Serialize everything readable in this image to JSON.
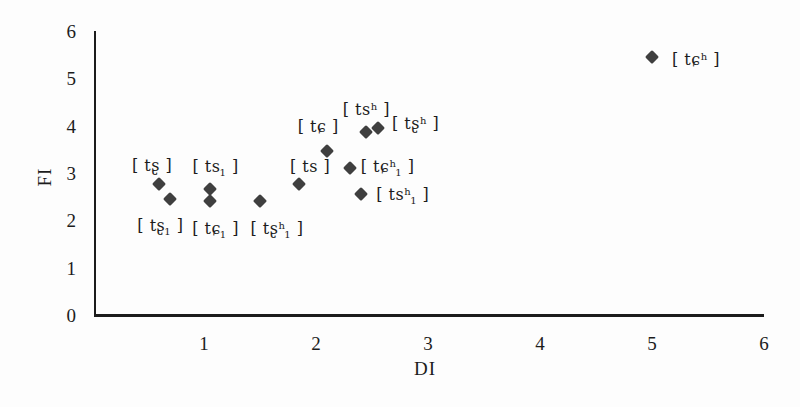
{
  "chart_data": {
    "type": "scatter",
    "title": "",
    "xlabel": "DI",
    "ylabel": "FI",
    "xlim": [
      0,
      6
    ],
    "ylim": [
      0,
      6
    ],
    "x_ticks": [
      "1",
      "2",
      "3",
      "4",
      "5",
      "6"
    ],
    "y_ticks": [
      "0",
      "1",
      "2",
      "3",
      "4",
      "5",
      "6"
    ],
    "grid": false,
    "legend": "none",
    "marker": {
      "shape": "diamond",
      "color": "#3f3f3f",
      "size_px": 10
    },
    "points": [
      {
        "id": "ts-retroflex",
        "label": "[tʂ]",
        "x": 0.6,
        "y": 2.8,
        "segments": [
          {
            "t": "[ tʂ ]",
            "s": "n"
          }
        ],
        "label_offset": [
          -7,
          -19
        ]
      },
      {
        "id": "ts-retroflex-sub1",
        "label": "[tʂ₁]",
        "x": 0.7,
        "y": 2.5,
        "segments": [
          {
            "t": "[ tʂ",
            "s": "n"
          },
          {
            "t": "1",
            "s": "sub"
          },
          {
            "t": " ]",
            "s": "n"
          }
        ],
        "label_offset": [
          -10,
          27
        ]
      },
      {
        "id": "ts-sub1",
        "label": "[ts₁]",
        "x": 1.05,
        "y": 2.7,
        "segments": [
          {
            "t": "[ ts",
            "s": "n"
          },
          {
            "t": "1",
            "s": "sub"
          },
          {
            "t": " ]",
            "s": "n"
          }
        ],
        "label_offset": [
          6,
          -22
        ]
      },
      {
        "id": "tc-curl-sub1",
        "label": "[tɕ₁]",
        "x": 1.05,
        "y": 2.45,
        "segments": [
          {
            "t": "[ tɕ",
            "s": "n"
          },
          {
            "t": "1",
            "s": "sub"
          },
          {
            "t": " ]",
            "s": "n"
          }
        ],
        "label_offset": [
          6,
          28
        ]
      },
      {
        "id": "ts-retroflex-asp-sub1",
        "label": "[tʂʰ₁]",
        "x": 1.5,
        "y": 2.45,
        "segments": [
          {
            "t": "[ tʂ",
            "s": "n"
          },
          {
            "t": "h",
            "s": "sup"
          },
          {
            "t": "1",
            "s": "sub"
          },
          {
            "t": " ]",
            "s": "n"
          }
        ],
        "label_offset": [
          17,
          28
        ]
      },
      {
        "id": "ts",
        "label": "[ts]",
        "x": 1.85,
        "y": 2.8,
        "segments": [
          {
            "t": "[ ts ]",
            "s": "n"
          }
        ],
        "label_offset": [
          11,
          -18
        ]
      },
      {
        "id": "tc-curl",
        "label": "[tɕ]",
        "x": 2.1,
        "y": 3.5,
        "segments": [
          {
            "t": "[ tɕ ]",
            "s": "n"
          }
        ],
        "label_offset": [
          -9,
          -25
        ]
      },
      {
        "id": "tc-curl-asp-sub1",
        "label": "[tɕʰ₁]",
        "x": 2.3,
        "y": 3.15,
        "segments": [
          {
            "t": "[ tɕ",
            "s": "n"
          },
          {
            "t": "h",
            "s": "sup"
          },
          {
            "t": "1",
            "s": "sub"
          },
          {
            "t": " ]",
            "s": "n"
          }
        ],
        "label_offset": [
          38,
          -1
        ]
      },
      {
        "id": "ts-asp-sub1",
        "label": "[tsʰ₁]",
        "x": 2.4,
        "y": 2.6,
        "segments": [
          {
            "t": "[ ts",
            "s": "n"
          },
          {
            "t": "h",
            "s": "sup"
          },
          {
            "t": "1",
            "s": "sub"
          },
          {
            "t": " ]",
            "s": "n"
          }
        ],
        "label_offset": [
          42,
          1
        ]
      },
      {
        "id": "ts-asp",
        "label": "[tsʰ]",
        "x": 2.45,
        "y": 3.9,
        "segments": [
          {
            "t": "[ ts",
            "s": "n"
          },
          {
            "t": "h",
            "s": "sup"
          },
          {
            "t": " ]",
            "s": "n"
          }
        ],
        "label_offset": [
          0,
          -23
        ]
      },
      {
        "id": "ts-retroflex-asp",
        "label": "[tʂʰ]",
        "x": 2.55,
        "y": 4.0,
        "segments": [
          {
            "t": "[ tʂ",
            "s": "n"
          },
          {
            "t": "h",
            "s": "sup"
          },
          {
            "t": " ]",
            "s": "n"
          }
        ],
        "label_offset": [
          38,
          -5
        ]
      },
      {
        "id": "tc-curl-asp",
        "label": "[tɕʰ]",
        "x": 5.0,
        "y": 5.5,
        "segments": [
          {
            "t": "[ tɕ",
            "s": "n"
          },
          {
            "t": "h",
            "s": "sup"
          },
          {
            "t": " ]",
            "s": "n"
          }
        ],
        "label_offset": [
          44,
          2
        ]
      }
    ]
  },
  "colors": {
    "axis": "#1c1c1c",
    "text": "#1c1c1c",
    "marker": "#3f3f3f",
    "background": "#fdfdfd"
  }
}
